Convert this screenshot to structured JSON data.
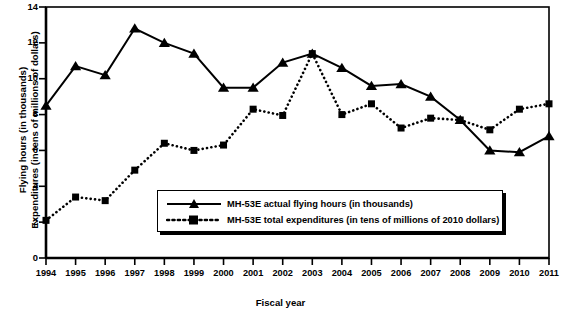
{
  "chart_data": {
    "type": "line",
    "title": "",
    "xlabel": "Fiscal year",
    "ylabel": "Flying hours (in thousands)\nExpenditures (in tens of millions of dollars)",
    "ylabel_line1": "Flying hours (in thousands)",
    "ylabel_line2": "Expenditures (in tens of millions of dollars)",
    "categories": [
      "1994",
      "1995",
      "1996",
      "1997",
      "1998",
      "1999",
      "2000",
      "2001",
      "2002",
      "2003",
      "2004",
      "2005",
      "2006",
      "2007",
      "2008",
      "2009",
      "2010",
      "2011"
    ],
    "x": [
      1994,
      1995,
      1996,
      1997,
      1998,
      1999,
      2000,
      2001,
      2002,
      2003,
      2004,
      2005,
      2006,
      2007,
      2008,
      2009,
      2010,
      2011
    ],
    "xlim": [
      1994,
      2011
    ],
    "ylim": [
      0,
      14
    ],
    "yticks": [
      0,
      2,
      4,
      6,
      8,
      10,
      12,
      14
    ],
    "grid": false,
    "legend_position": "inside-bottom-center",
    "series": [
      {
        "name": "MH-53E actual flying hours (in thousands)",
        "marker": "triangle",
        "line_style": "solid",
        "color": "#000000",
        "values": [
          8.5,
          10.7,
          10.2,
          12.8,
          12.0,
          11.4,
          9.5,
          9.5,
          10.9,
          11.4,
          10.6,
          9.6,
          9.7,
          9.0,
          7.7,
          6.0,
          5.9,
          6.8
        ]
      },
      {
        "name": "MH-53E total expenditures (in tens of millions of 2010 dollars)",
        "marker": "square",
        "line_style": "dotted",
        "color": "#000000",
        "values": [
          2.1,
          3.4,
          3.2,
          4.9,
          6.4,
          6.0,
          6.3,
          8.3,
          7.95,
          11.4,
          8.0,
          8.6,
          7.25,
          7.8,
          7.7,
          7.15,
          8.3,
          8.6
        ]
      }
    ]
  },
  "legend": {
    "items": [
      {
        "label": "MH-53E actual flying hours (in thousands)",
        "marker": "triangle-icon",
        "style": "solid"
      },
      {
        "label": "MH-53E total expenditures (in tens of millions of 2010 dollars)",
        "marker": "square-icon",
        "style": "dotted"
      }
    ]
  },
  "axes": {
    "y_tick_labels": [
      "0",
      "2",
      "4",
      "6",
      "8",
      "10",
      "12",
      "14"
    ],
    "x_tick_labels": [
      "1994",
      "1995",
      "1996",
      "1997",
      "1998",
      "1999",
      "2000",
      "2001",
      "2002",
      "2003",
      "2004",
      "2005",
      "2006",
      "2007",
      "2008",
      "2009",
      "2010",
      "2011"
    ]
  }
}
